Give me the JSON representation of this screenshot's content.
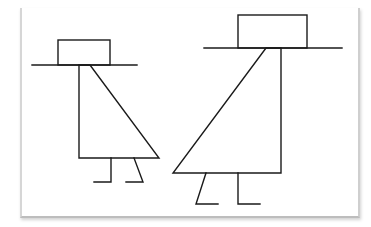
{
  "scene": {
    "description": "Line drawing of two stick figures wearing hats and triangular dresses on a sheet of paper",
    "stroke_color": "#1a1a1a",
    "paper_color": "#ffffff"
  },
  "figures": [
    {
      "name": "left-figure",
      "hat": {
        "x": 58,
        "y": 40,
        "w": 52,
        "h": 25
      },
      "brim": {
        "x1": 32,
        "x2": 137,
        "y": 65
      },
      "body": {
        "vertical_x": 79,
        "top_y": 65,
        "bottom_y": 158,
        "diag_top_x": 90,
        "diag_bottom_x": 159
      },
      "legs": [
        {
          "x1": 111,
          "y1": 158,
          "x2": 111,
          "y2": 182,
          "foot_x": 94
        },
        {
          "x1": 134,
          "y1": 158,
          "x2": 143,
          "y2": 182,
          "foot_x": 126
        }
      ]
    },
    {
      "name": "right-figure",
      "hat": {
        "x": 238,
        "y": 15,
        "w": 69,
        "h": 33
      },
      "brim": {
        "x1": 204,
        "x2": 342,
        "y": 48
      },
      "body": {
        "vertical_x": 281,
        "top_y": 48,
        "bottom_y": 173,
        "diag_top_x": 266,
        "diag_bottom_x": 173
      },
      "legs": [
        {
          "x1": 206,
          "y1": 173,
          "x2": 196,
          "y2": 204,
          "foot_x": 218
        },
        {
          "x1": 238,
          "y1": 173,
          "x2": 238,
          "y2": 204,
          "foot_x": 260
        }
      ]
    }
  ]
}
